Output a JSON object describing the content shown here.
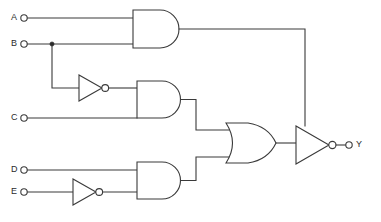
{
  "diagram": {
    "type": "digital-logic-schematic",
    "background_color": "#ffffff",
    "line_color": "#3a3a3a",
    "text_color": "#2b2b2b"
  },
  "inputs": [
    {
      "id": "A",
      "label": "A",
      "terminal_x": 24,
      "terminal_y": 18
    },
    {
      "id": "B",
      "label": "B",
      "terminal_x": 24,
      "terminal_y": 44
    },
    {
      "id": "C",
      "label": "C",
      "terminal_x": 24,
      "terminal_y": 118
    },
    {
      "id": "D",
      "label": "D",
      "terminal_x": 24,
      "terminal_y": 170
    },
    {
      "id": "E",
      "label": "E",
      "terminal_x": 24,
      "terminal_y": 192
    }
  ],
  "outputs": [
    {
      "id": "Y",
      "label": "Y",
      "terminal_x": 349,
      "terminal_y": 145
    }
  ],
  "gates": [
    {
      "id": "AND1",
      "type": "and",
      "label": "AND",
      "inputs": [
        "A",
        "B"
      ],
      "output": "n1"
    },
    {
      "id": "NOT1",
      "type": "not",
      "label": "NOT",
      "inputs": [
        "B"
      ],
      "output": "nB"
    },
    {
      "id": "AND2",
      "type": "and",
      "label": "AND",
      "inputs": [
        "nB",
        "C"
      ],
      "output": "n2"
    },
    {
      "id": "NOT2",
      "type": "not",
      "label": "NOT",
      "inputs": [
        "E"
      ],
      "output": "nE"
    },
    {
      "id": "AND3",
      "type": "and",
      "label": "AND",
      "inputs": [
        "D",
        "nE"
      ],
      "output": "n3"
    },
    {
      "id": "OR1",
      "type": "or",
      "label": "OR",
      "inputs": [
        "n2",
        "n3"
      ],
      "output": "n4"
    },
    {
      "id": "NOT3",
      "type": "not",
      "label": "NOT",
      "inputs": [
        "n4",
        "n1"
      ],
      "output": "Y"
    }
  ],
  "nets": [
    {
      "id": "n1",
      "from": "AND1",
      "to": "NOT3"
    },
    {
      "id": "nB",
      "from": "NOT1",
      "to": "AND2"
    },
    {
      "id": "n2",
      "from": "AND2",
      "to": "OR1"
    },
    {
      "id": "nE",
      "from": "NOT2",
      "to": "AND3"
    },
    {
      "id": "n3",
      "from": "AND3",
      "to": "OR1"
    },
    {
      "id": "n4",
      "from": "OR1",
      "to": "NOT3"
    }
  ],
  "junctions": [
    {
      "id": "B-tap",
      "x": 52,
      "y": 44
    }
  ],
  "expression": {
    "output": "Y",
    "formula": "Y = NOT( (A AND B) OR (NOT B AND C) OR (D AND NOT E) )"
  }
}
